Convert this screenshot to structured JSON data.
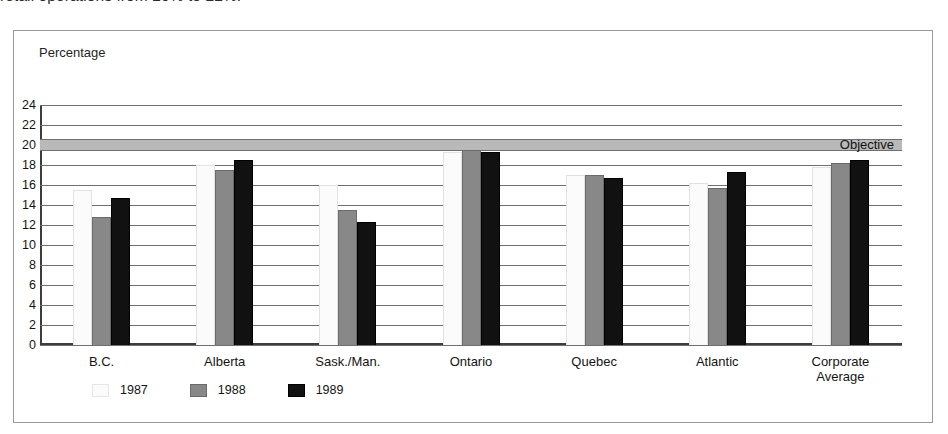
{
  "caption": {
    "text": "retail operations from 20% to 22%."
  },
  "chart_data": {
    "type": "bar",
    "title": "",
    "axis_title": "Percentage",
    "xlabel": "",
    "ylabel": "Percentage",
    "ylim": [
      0,
      24
    ],
    "ytick_step": 2,
    "yticks": [
      "24",
      "22",
      "20",
      "18",
      "16",
      "14",
      "12",
      "10",
      "8",
      "6",
      "4",
      "2",
      "0"
    ],
    "grid": true,
    "legend_position": "bottom-left",
    "categories": [
      "B.C.",
      "Alberta",
      "Sask./Man.",
      "Ontario",
      "Quebec",
      "Atlantic",
      "Corporate\nAverage"
    ],
    "series": [
      {
        "name": "1987",
        "color": "#fbfbfb",
        "values": [
          15.5,
          18.0,
          16.0,
          19.3,
          17.0,
          16.2,
          17.8
        ]
      },
      {
        "name": "1988",
        "color": "#888888",
        "values": [
          12.8,
          17.5,
          13.5,
          19.5,
          17.0,
          15.7,
          18.2
        ]
      },
      {
        "name": "1989",
        "color": "#111111",
        "values": [
          14.7,
          18.5,
          12.3,
          19.3,
          16.7,
          17.3,
          18.5
        ]
      }
    ],
    "annotations": [
      {
        "name": "objective",
        "label": "Objective",
        "value": 20,
        "band": [
          19.4,
          20.6
        ],
        "color": "#b9b9b9"
      }
    ]
  }
}
